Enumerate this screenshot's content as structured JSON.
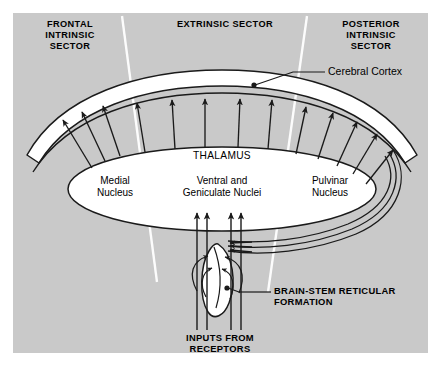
{
  "figure": {
    "background_color": "#c9c9c9",
    "page_color": "#ffffff",
    "stroke_color": "#1a1a1a",
    "divider_color": "#ffffff"
  },
  "sectors": [
    {
      "id": "frontal",
      "label": "FRONTAL\nINTRINSIC\nSECTOR"
    },
    {
      "id": "extrinsic",
      "label": "EXTRINSIC SECTOR"
    },
    {
      "id": "posterior",
      "label": "POSTERIOR\nINTRINSIC\nSECTOR"
    }
  ],
  "structures": {
    "cortex_label": "Cerebral Cortex",
    "thalamus_label": "THALAMUS",
    "nuclei": [
      {
        "id": "medial",
        "label": "Medial\nNucleus"
      },
      {
        "id": "ventral-geniculate",
        "label": "Ventral and\nGeniculate Nuclei"
      },
      {
        "id": "pulvinar",
        "label": "Pulvinar\nNucleus"
      }
    ],
    "reticular_label": "BRAIN-STEM RETICULAR\nFORMATION",
    "inputs_label": "INPUTS FROM\nRECEPTORS"
  }
}
